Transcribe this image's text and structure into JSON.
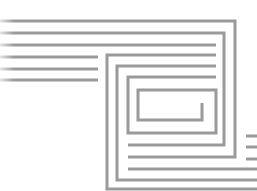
{
  "diagram": {
    "type": "maze-spiral-line-art",
    "stroke_color": "#9a9a9a",
    "stroke_width": 3,
    "background": "#ffffff",
    "segments": [
      {
        "id": "top-1",
        "points": [
          [
            0,
            21
          ],
          [
            235,
            21
          ],
          [
            235,
            157
          ],
          [
            128,
            157
          ]
        ]
      },
      {
        "id": "top-2",
        "points": [
          [
            0,
            33
          ],
          [
            224,
            33
          ],
          [
            224,
            145
          ],
          [
            128,
            145
          ]
        ]
      },
      {
        "id": "top-3",
        "points": [
          [
            0,
            45
          ],
          [
            216,
            45
          ]
        ]
      },
      {
        "id": "left-stub-1",
        "points": [
          [
            0,
            57
          ],
          [
            98,
            57
          ]
        ]
      },
      {
        "id": "left-stub-2",
        "points": [
          [
            0,
            69
          ],
          [
            98,
            69
          ]
        ]
      },
      {
        "id": "left-stub-3",
        "points": [
          [
            0,
            80
          ],
          [
            98,
            80
          ]
        ]
      },
      {
        "id": "frame-1",
        "points": [
          [
            216,
            55
          ],
          [
            107,
            55
          ],
          [
            107,
            189
          ],
          [
            257,
            189
          ]
        ]
      },
      {
        "id": "frame-2",
        "points": [
          [
            216,
            66
          ],
          [
            117,
            66
          ],
          [
            117,
            180
          ],
          [
            257,
            180
          ]
        ]
      },
      {
        "id": "frame-3",
        "points": [
          [
            216,
            77
          ],
          [
            128,
            77
          ],
          [
            128,
            133
          ],
          [
            216,
            133
          ],
          [
            216,
            90
          ],
          [
            138,
            90
          ],
          [
            138,
            120
          ],
          [
            202,
            120
          ],
          [
            202,
            103
          ]
        ]
      },
      {
        "id": "bottom-1",
        "points": [
          [
            128,
            169
          ],
          [
            257,
            169
          ]
        ]
      },
      {
        "id": "right-stub-1",
        "points": [
          [
            246,
            136
          ],
          [
            257,
            136
          ]
        ]
      },
      {
        "id": "right-stub-2",
        "points": [
          [
            246,
            147
          ],
          [
            257,
            147
          ]
        ]
      },
      {
        "id": "right-stub-3",
        "points": [
          [
            246,
            159
          ],
          [
            257,
            159
          ]
        ]
      }
    ]
  }
}
